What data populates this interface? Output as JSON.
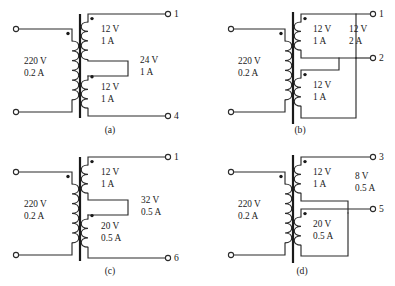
{
  "figure": {
    "background": "#ffffff",
    "ink": "#1a1a1a",
    "panel_count": 4
  },
  "panels": [
    {
      "id": "a",
      "caption": "(a)",
      "primary": {
        "voltage": "220 V",
        "current": "0.2 A",
        "dot": "top"
      },
      "secondaries": [
        {
          "voltage": "12 V",
          "current": "1 A",
          "dot": "top"
        },
        {
          "voltage": "12 V",
          "current": "1 A",
          "dot": "top"
        }
      ],
      "output": {
        "voltage": "24 V",
        "current": "1 A"
      },
      "terminals": [
        {
          "label": "1",
          "position": "top-right"
        },
        {
          "label": "4",
          "position": "bottom-right"
        }
      ],
      "connection": "series-aiding"
    },
    {
      "id": "b",
      "caption": "(b)",
      "primary": {
        "voltage": "220 V",
        "current": "0.2 A",
        "dot": "top"
      },
      "secondaries": [
        {
          "voltage": "12 V",
          "current": "1 A",
          "dot": "top"
        },
        {
          "voltage": "12 V",
          "current": "1 A",
          "dot": "top"
        }
      ],
      "output": {
        "voltage": "12 V",
        "current": "2 A"
      },
      "terminals": [
        {
          "label": "1",
          "position": "top-right"
        },
        {
          "label": "2",
          "position": "mid-right"
        }
      ],
      "connection": "parallel"
    },
    {
      "id": "c",
      "caption": "(c)",
      "primary": {
        "voltage": "220 V",
        "current": "0.2 A",
        "dot": "top"
      },
      "secondaries": [
        {
          "voltage": "12 V",
          "current": "1 A",
          "dot": "top"
        },
        {
          "voltage": "20 V",
          "current": "0.5 A",
          "dot": "top"
        }
      ],
      "output": {
        "voltage": "32 V",
        "current": "0.5 A"
      },
      "terminals": [
        {
          "label": "1",
          "position": "top-right"
        },
        {
          "label": "6",
          "position": "bottom-right"
        }
      ],
      "connection": "series-aiding"
    },
    {
      "id": "d",
      "caption": "(d)",
      "primary": {
        "voltage": "220 V",
        "current": "0.2 A",
        "dot": "top"
      },
      "secondaries": [
        {
          "voltage": "12 V",
          "current": "1 A",
          "dot": "top"
        },
        {
          "voltage": "20 V",
          "current": "0.5 A",
          "dot": "top"
        }
      ],
      "output": {
        "voltage": "8 V",
        "current": "0.5 A"
      },
      "terminals": [
        {
          "label": "3",
          "position": "top-right"
        },
        {
          "label": "5",
          "position": "mid-right"
        }
      ],
      "connection": "series-opposing"
    }
  ]
}
